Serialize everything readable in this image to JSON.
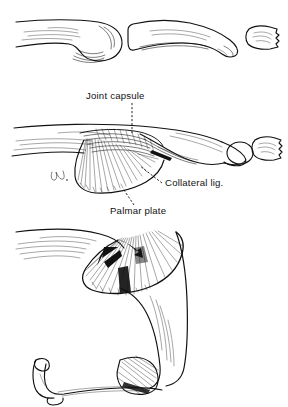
{
  "figure": {
    "background_color": "#ffffff",
    "ink_color": "#111111",
    "width": 288,
    "height": 407,
    "style": "pen-and-ink medical illustration"
  },
  "labels": [
    {
      "id": "joint-capsule",
      "text": "Joint capsule",
      "x": 86,
      "y": 99,
      "leader": "vertical-dashed-down"
    },
    {
      "id": "collateral-lig",
      "text": "Collateral lig.",
      "x": 165,
      "y": 186,
      "leader": "dashed-up-left"
    },
    {
      "id": "palmar-plate",
      "text": "Palmar plate",
      "x": 110,
      "y": 214,
      "leader": "dashed-up-right"
    }
  ],
  "panels": [
    {
      "id": "panel-bones",
      "order": 1,
      "caption": "",
      "description": "Bones only: proximal phalanx head, middle phalanx, distal phalanx tuft",
      "parts": [
        "proximal-phalanx",
        "middle-phalanx",
        "distal-phalanx"
      ]
    },
    {
      "id": "panel-extended",
      "order": 2,
      "caption": "",
      "description": "Joint in extension with capsule, collateral ligament and palmar plate shown",
      "parts": [
        "joint-capsule",
        "collateral-ligament",
        "palmar-plate",
        "proximal-phalanx",
        "middle-phalanx",
        "distal-phalanx"
      ]
    },
    {
      "id": "panel-flexed",
      "order": 3,
      "caption": "",
      "description": "Joint in flexion; arrow indicates direction of palmar plate folding",
      "parts": [
        "palmar-plate",
        "collateral-ligament",
        "flexion-arrow",
        "distal-segment"
      ]
    }
  ],
  "annotations": [
    {
      "id": "flexion-arrow",
      "type": "solid-arrow",
      "direction": "down-left",
      "panel": "panel-flexed"
    },
    {
      "id": "artist-mark",
      "type": "signature-initials",
      "panel": "panel-extended"
    }
  ]
}
